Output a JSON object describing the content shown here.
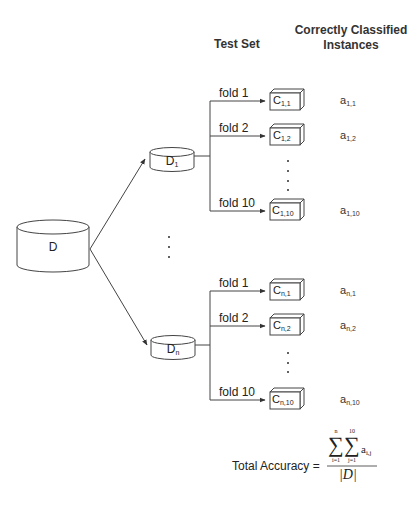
{
  "headers": {
    "test_set": "Test Set",
    "correct_line1": "Correctly Classified",
    "correct_line2": "Instances"
  },
  "root_dataset": {
    "label": "D"
  },
  "datasets": [
    {
      "label_base": "D",
      "label_sub": "1",
      "folds": [
        {
          "fold": "fold 1",
          "classifier_base": "C",
          "classifier_sub": "1,1",
          "acc_base": "a",
          "acc_sub": "1,1"
        },
        {
          "fold": "fold 2",
          "classifier_base": "C",
          "classifier_sub": "1,2",
          "acc_base": "a",
          "acc_sub": "1,2"
        },
        {
          "fold": "fold 10",
          "classifier_base": "C",
          "classifier_sub": "1,10",
          "acc_base": "a",
          "acc_sub": "1,10"
        }
      ]
    },
    {
      "label_base": "D",
      "label_sub": "n",
      "folds": [
        {
          "fold": "fold 1",
          "classifier_base": "C",
          "classifier_sub": "n,1",
          "acc_base": "a",
          "acc_sub": "n,1"
        },
        {
          "fold": "fold 2",
          "classifier_base": "C",
          "classifier_sub": "n,2",
          "acc_base": "a",
          "acc_sub": "n,2"
        },
        {
          "fold": "fold 10",
          "classifier_base": "C",
          "classifier_sub": "n,10",
          "acc_base": "a",
          "acc_sub": "n,10"
        }
      ]
    }
  ],
  "formula": {
    "label": "Total Accuracy =",
    "sum1_upper": "n",
    "sum1_lower": "i=1",
    "sum2_upper": "10",
    "sum2_lower": "j=1",
    "term_base": "a",
    "term_sub": "i,j",
    "denominator": "|D|",
    "sigma": "∑"
  },
  "colors": {
    "stroke": "#444444",
    "text": "#222222",
    "background": "#ffffff"
  }
}
